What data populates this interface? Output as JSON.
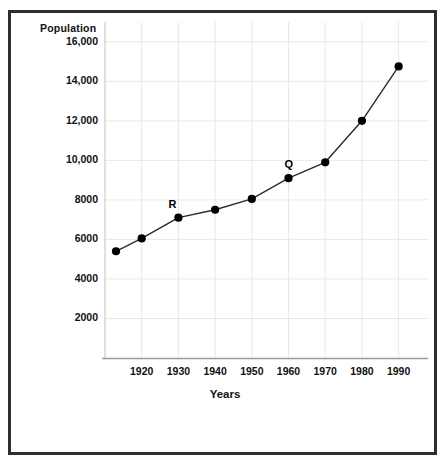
{
  "chart_data": {
    "type": "line",
    "title": "",
    "xlabel": "Years",
    "ylabel": "Population",
    "grid": true,
    "legend": "none",
    "xlim": [
      1910,
      1998
    ],
    "ylim": [
      0,
      17000
    ],
    "x": [
      1913,
      1920,
      1930,
      1940,
      1950,
      1960,
      1970,
      1980,
      1990
    ],
    "values": [
      5400,
      6050,
      7100,
      7500,
      8050,
      9100,
      9900,
      12000,
      14750
    ],
    "xticks": [
      "1920",
      "1930",
      "1940",
      "1950",
      "1960",
      "1970",
      "1980",
      "1990"
    ],
    "xtick_values": [
      1920,
      1930,
      1940,
      1950,
      1960,
      1970,
      1980,
      1990
    ],
    "yticks": [
      "2000",
      "4000",
      "6000",
      "8000",
      "10,000",
      "12,000",
      "14,000",
      "16,000"
    ],
    "ytick_values": [
      2000,
      4000,
      6000,
      8000,
      10000,
      12000,
      14000,
      16000
    ],
    "annotations": [
      {
        "label": "Q",
        "x": 1960,
        "y": 9100
      },
      {
        "label": "R",
        "x": 1930,
        "y": 7100
      }
    ],
    "colors": {
      "line": "#2b2b2b",
      "marker": "#000000",
      "grid": "#e8e8e8",
      "axis": "#b9b9b9",
      "frame": "#2e2e2e",
      "text": "#111111",
      "background": "#ffffff"
    }
  }
}
